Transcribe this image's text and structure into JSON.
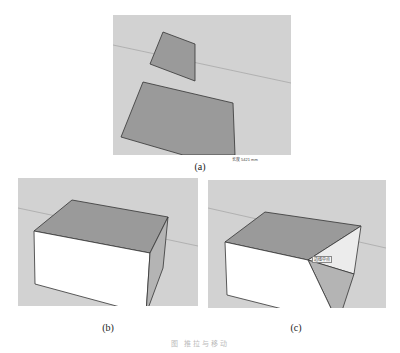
{
  "figure": {
    "panels": [
      {
        "id": "a",
        "label": "(a)",
        "status_text": "长度 5421 mm"
      },
      {
        "id": "b",
        "label": "(b)"
      },
      {
        "id": "c",
        "label": "(c)",
        "tooltip_text": "边线中点"
      }
    ],
    "caption": "图  推拉与移动"
  },
  "colors": {
    "background": "#d2d2d2",
    "face_top": "#9a9a9a",
    "face_front": "#ffffff",
    "face_side": "#b4b4b4",
    "horizon": "#a8a8a8",
    "edge": "#333333"
  }
}
